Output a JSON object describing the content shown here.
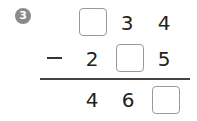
{
  "problem": {
    "number": "3",
    "operator": "−",
    "minuend": {
      "hundreds": "",
      "tens": "3",
      "ones": "4"
    },
    "subtrahend": {
      "hundreds": "2",
      "tens": "",
      "ones": "5"
    },
    "difference": {
      "hundreds": "4",
      "tens": "6",
      "ones": ""
    }
  },
  "colors": {
    "badge": "#8a8a8a",
    "box_border": "#9a9a9a",
    "text": "#222222"
  }
}
